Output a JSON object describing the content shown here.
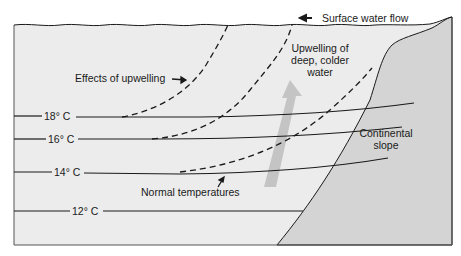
{
  "diagram": {
    "type": "cross-section",
    "colors": {
      "ocean": "#ececec",
      "land": "#d4d4d4",
      "line": "#1a1a1a",
      "upwelling_arrow": "#bdbdbd",
      "background": "#ffffff"
    },
    "labels": {
      "surface_flow": "Surface water flow",
      "upwelling_line1": "Upwelling of",
      "upwelling_line2": "deep, colder",
      "upwelling_line3": "water",
      "effects": "Effects of upwelling",
      "normal": "Normal temperatures",
      "slope_line1": "Continental",
      "slope_line2": "slope"
    },
    "isotherms": [
      {
        "label": "18° C",
        "style": "solid"
      },
      {
        "label": "16° C",
        "style": "solid"
      },
      {
        "label": "14° C",
        "style": "solid"
      },
      {
        "label": "12° C",
        "style": "solid"
      }
    ]
  }
}
